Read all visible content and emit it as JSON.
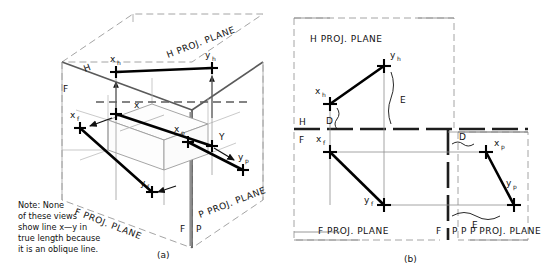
{
  "figure": {
    "panels": [
      {
        "id": "a",
        "caption": "(a)",
        "type": "pictorial-glass-box",
        "plane_labels": [
          "H PROJ. PLANE",
          "F PROJ. PLANE",
          "P PROJ. PLANE"
        ],
        "fold_labels": [
          "H",
          "F",
          "F",
          "P"
        ],
        "point_labels": [
          "x_h",
          "y_h",
          "x_f",
          "y_f",
          "x_p",
          "y_p",
          "x",
          "Y"
        ],
        "note": "Note: None of these views show line x—y in true length because it is an oblique line."
      },
      {
        "id": "b",
        "caption": "(b)",
        "type": "orthographic-unfolded",
        "plane_labels": [
          "H PROJ. PLANE",
          "F PROJ. PLANE",
          "P PROJ. PLANE"
        ],
        "fold_labels": [
          "H",
          "F",
          "F",
          "P"
        ],
        "point_labels": [
          "x_h",
          "y_h",
          "x_f",
          "y_f",
          "x_p",
          "y_p"
        ],
        "dimension_labels": [
          "D",
          "E",
          "D",
          "E"
        ]
      }
    ]
  },
  "panel_a": {
    "caption": "(a)",
    "h_plane_label": "H PROJ. PLANE",
    "f_plane_label": "F PROJ. PLANE",
    "p_plane_label": "P PROJ. PLANE",
    "fold_h": "H",
    "fold_f": "F",
    "fold_f2": "F",
    "fold_p": "P",
    "pt_xh": "x",
    "pt_xh_sub": "h",
    "pt_yh": "y",
    "pt_yh_sub": "h",
    "pt_xf": "x",
    "pt_xf_sub": "f",
    "pt_yf": "y",
    "pt_yf_sub": "f",
    "pt_xp": "x",
    "pt_xp_sub": "p",
    "pt_yp": "y",
    "pt_yp_sub": "p",
    "pt_x": "x",
    "pt_y": "Y",
    "note_line1": "Note: None",
    "note_line2": "of these views",
    "note_line3": "show line x—y in",
    "note_line4": "true length because",
    "note_line5": "it is an oblique line."
  },
  "panel_b": {
    "caption": "(b)",
    "h_plane_label": "H PROJ. PLANE",
    "f_plane_label": "F PROJ. PLANE",
    "p_plane_label": "P PROJ. PLANE",
    "fold_h": "H",
    "fold_f": "F",
    "fold_f2": "F",
    "fold_p": "P",
    "fold_p2": "P",
    "pt_xh": "x",
    "pt_xh_sub": "h",
    "pt_yh": "y",
    "pt_yh_sub": "h",
    "pt_xf": "x",
    "pt_xf_sub": "f",
    "pt_yf": "y",
    "pt_yf_sub": "f",
    "pt_xp": "x",
    "pt_xp_sub": "p",
    "pt_yp": "y",
    "pt_yp_sub": "p",
    "dim_d_top": "D",
    "dim_e_top": "E",
    "dim_d_right": "D",
    "dim_e_bottom": "E"
  },
  "colors": {
    "ink": "#111111",
    "thin": "#8a8a8a",
    "medium": "#555555",
    "background": "#ffffff"
  }
}
